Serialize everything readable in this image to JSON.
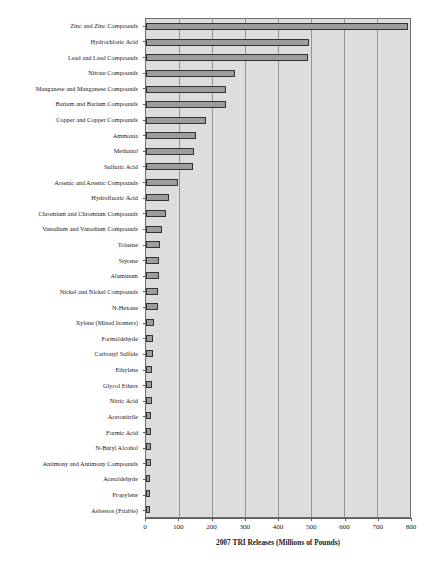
{
  "chart_data": {
    "type": "bar",
    "orientation": "horizontal",
    "title": "",
    "xlabel": "2007 TRI Releases (Millions of Pounds)",
    "ylabel": "",
    "xlim": [
      0,
      800
    ],
    "xticks": [
      0,
      100,
      200,
      300,
      400,
      500,
      600,
      700,
      800
    ],
    "xtick_labels": [
      "0",
      "100",
      "200",
      "300",
      "400",
      "500",
      "600",
      "700",
      "800"
    ],
    "grid": "vertical",
    "legend": "none",
    "categories": [
      "Zinc and Zinc Compounds",
      "Hydrochloric Acid",
      "Lead and Lead Compounds",
      "Nitrate Compounds",
      "Manganese and Manganese Compounds",
      "Barium and Barium Compounds",
      "Copper and Copper Compounds",
      "Ammonia",
      "Methanol",
      "Sulfuric Acid",
      "Arsenic and Arsenic Compounds",
      "Hydrofluoric Acid",
      "Chromium and Chromium Compounds",
      "Vanadium and Vanadium Compounds",
      "Toluene",
      "Styrene",
      "Aluminum",
      "Nickel and Nickel Compounds",
      "N-Hexane",
      "Xylene (Mixed Isomers)",
      "Formaldehyde",
      "Carbonyl Sulfide",
      "Ethylene",
      "Glycol Ethers",
      "Nitric Acid",
      "Acetonitrile",
      "Formic Acid",
      "N-Butyl Alcohol",
      "Antimony and Antimony Compounds",
      "Acetaldehyde",
      "Propylene",
      "Asbestos (Friable)"
    ],
    "values": [
      793,
      494,
      490,
      269,
      243,
      242,
      181,
      152,
      145,
      142,
      96,
      71,
      61,
      47,
      41,
      40,
      39,
      37,
      35,
      24,
      21,
      20,
      19,
      18,
      17,
      16,
      15,
      15,
      14,
      13,
      13,
      12
    ],
    "colors": {
      "bar_fill": "#9d9d9d",
      "bar_border": "#333333",
      "plot_background": "#dddddd",
      "gridline": "#949494",
      "axis": "#5a5a5a",
      "text": "#1a1a1a"
    }
  }
}
